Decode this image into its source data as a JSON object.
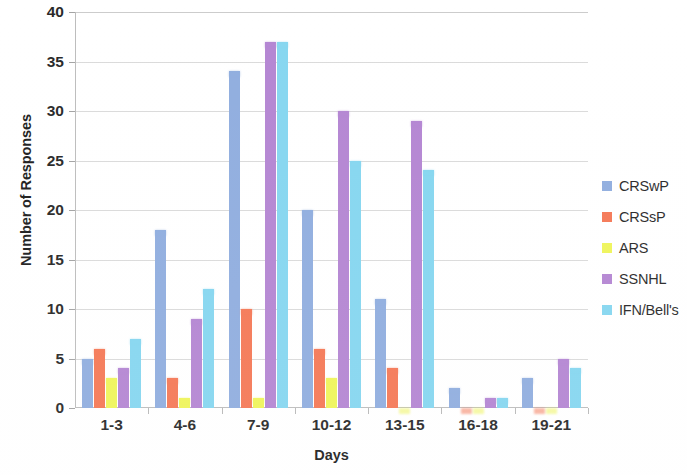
{
  "chart_data": {
    "type": "bar",
    "title": "",
    "xlabel": "Days",
    "ylabel": "Number of Responses",
    "ylim": [
      0,
      40
    ],
    "ytick_step": 5,
    "yticks": [
      0,
      5,
      10,
      15,
      20,
      25,
      30,
      35,
      40
    ],
    "grid": true,
    "legend_position": "right",
    "categories": [
      "1-3",
      "4-6",
      "7-9",
      "10-12",
      "13-15",
      "16-18",
      "19-21"
    ],
    "series": [
      {
        "name": "CRSwP",
        "color": "#8aa9dd",
        "values": [
          5,
          18,
          34,
          20,
          11,
          2,
          3
        ]
      },
      {
        "name": "CRSsP",
        "color": "#f4714d",
        "values": [
          6,
          3,
          10,
          6,
          4,
          0,
          0
        ]
      },
      {
        "name": "ARS",
        "color": "#eef451",
        "values": [
          3,
          1,
          1,
          3,
          0,
          0,
          0
        ]
      },
      {
        "name": "SSNHL",
        "color": "#b07fd0",
        "values": [
          4,
          9,
          37,
          30,
          29,
          1,
          5
        ]
      },
      {
        "name": "IFN/Bell's",
        "color": "#7fd4ef",
        "values": [
          7,
          12,
          37,
          25,
          24,
          1,
          4
        ]
      }
    ]
  },
  "legend": {
    "items": [
      {
        "label": "CRSwP",
        "color": "#8aa9dd"
      },
      {
        "label": "CRSsP",
        "color": "#f4714d"
      },
      {
        "label": "ARS",
        "color": "#eef451"
      },
      {
        "label": "SSNHL",
        "color": "#b07fd0"
      },
      {
        "label": "IFN/Bell's",
        "color": "#7fd4ef"
      }
    ]
  }
}
